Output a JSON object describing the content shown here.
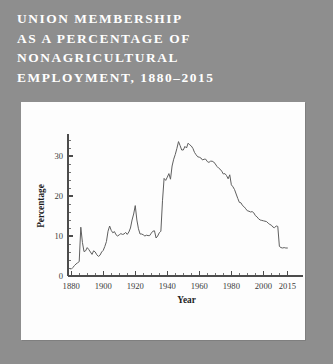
{
  "title": {
    "lines": [
      "UNION MEMBERSHIP",
      "AS A PERCENTAGE OF",
      "NONAGRICULTURAL",
      "EMPLOYMENT, 1880–2015"
    ]
  },
  "colors": {
    "background": "#8e8e8e",
    "panel": "#fdfdfd",
    "title_text": "#ffffff",
    "line": "#5f5f5f",
    "axis": "#4c4c4c"
  },
  "chart_data": {
    "type": "line",
    "title": "Union Membership as a Percentage of Nonagricultural Employment, 1880–2015",
    "xlabel": "Year",
    "ylabel": "Percentage",
    "xlim": [
      1878,
      2016
    ],
    "ylim": [
      0,
      35
    ],
    "grid": false,
    "legend": null,
    "x_ticks": [
      1880,
      1900,
      1920,
      1940,
      1960,
      1980,
      2000,
      2015
    ],
    "x_tick_labels": [
      "1880",
      "1900",
      "1920",
      "1940",
      "1960",
      "1980",
      "2000",
      "2015"
    ],
    "x_minor_step": 5,
    "y_ticks": [
      0,
      10,
      20,
      30
    ],
    "y_tick_labels": [
      "0",
      "10",
      "20",
      "30"
    ],
    "y_minor_step": 2,
    "series": [
      {
        "name": "Union membership share",
        "x": [
          1880,
          1881,
          1882,
          1883,
          1884,
          1885,
          1886,
          1887,
          1888,
          1889,
          1890,
          1891,
          1892,
          1893,
          1894,
          1895,
          1896,
          1897,
          1898,
          1899,
          1900,
          1901,
          1902,
          1903,
          1904,
          1905,
          1906,
          1907,
          1908,
          1909,
          1910,
          1911,
          1912,
          1913,
          1914,
          1915,
          1916,
          1917,
          1918,
          1919,
          1920,
          1921,
          1922,
          1923,
          1924,
          1925,
          1926,
          1927,
          1928,
          1929,
          1930,
          1931,
          1932,
          1933,
          1934,
          1935,
          1936,
          1937,
          1938,
          1939,
          1940,
          1941,
          1942,
          1943,
          1944,
          1945,
          1946,
          1947,
          1948,
          1949,
          1950,
          1951,
          1952,
          1953,
          1954,
          1955,
          1956,
          1957,
          1958,
          1959,
          1960,
          1961,
          1962,
          1963,
          1964,
          1965,
          1966,
          1967,
          1968,
          1969,
          1970,
          1971,
          1972,
          1973,
          1974,
          1975,
          1976,
          1977,
          1978,
          1979,
          1980,
          1981,
          1982,
          1983,
          1984,
          1985,
          1986,
          1987,
          1988,
          1989,
          1990,
          1991,
          1992,
          1993,
          1994,
          1995,
          1996,
          1997,
          1998,
          1999,
          2000,
          2001,
          2002,
          2003,
          2004,
          2005,
          2006,
          2007,
          2008,
          2009,
          2010,
          2011,
          2012,
          2013,
          2014,
          2015
        ],
        "y": [
          1.7,
          2.1,
          2.6,
          3.0,
          3.3,
          3.6,
          12.2,
          8.4,
          6.1,
          6.3,
          7.1,
          6.6,
          6.0,
          5.4,
          6.3,
          6.0,
          5.3,
          4.9,
          5.2,
          6.0,
          6.4,
          7.4,
          8.6,
          11.2,
          12.5,
          11.4,
          10.8,
          11.1,
          10.3,
          10.0,
          10.3,
          10.6,
          10.4,
          10.5,
          10.9,
          10.4,
          11.0,
          12.0,
          14.0,
          15.5,
          17.6,
          14.0,
          11.8,
          10.5,
          10.5,
          10.3,
          10.0,
          10.2,
          10.1,
          10.1,
          10.7,
          11.2,
          11.3,
          9.5,
          10.0,
          10.8,
          11.2,
          18.8,
          24.4,
          23.9,
          24.7,
          25.6,
          24.2,
          27.5,
          29.2,
          30.4,
          31.9,
          33.6,
          32.6,
          31.5,
          31.5,
          32.4,
          32.0,
          33.2,
          32.8,
          32.5,
          31.9,
          30.9,
          30.3,
          29.8,
          29.7,
          29.5,
          29.0,
          29.2,
          29.2,
          28.6,
          28.4,
          28.7,
          28.7,
          28.5,
          28.0,
          27.4,
          27.0,
          26.7,
          26.2,
          25.5,
          25.6,
          25.1,
          24.3,
          25.3,
          22.8,
          22.3,
          21.6,
          20.5,
          19.4,
          18.4,
          18.3,
          17.6,
          17.3,
          16.8,
          16.3,
          16.2,
          16.0,
          16.1,
          15.8,
          15.1,
          14.8,
          14.3,
          14.0,
          13.9,
          13.8,
          13.7,
          13.6,
          13.2,
          12.9,
          12.7,
          12.2,
          12.1,
          12.5,
          12.4,
          7.4,
          7.1,
          7.0,
          7.1,
          7.0,
          7.0
        ]
      }
    ]
  }
}
